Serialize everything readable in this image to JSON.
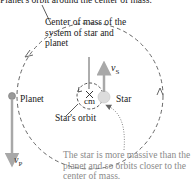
{
  "diagram": {
    "top_caption": "Planet's orbit around the center of mass.",
    "center_of_mass_label": [
      "Center of mass of the",
      "system of star and",
      "planet"
    ],
    "planet_label": "Planet",
    "star_label": "Star",
    "cm_label": "cm",
    "star_orbit_label": "Star's orbit",
    "star_velocity": {
      "symbol": "v",
      "subscript": "S"
    },
    "planet_velocity": {
      "symbol": "v",
      "subscript": "P"
    },
    "note": "The star is more massive than the planet and so orbits closer to the center of mass.",
    "colors": {
      "text": "#1a1a1a",
      "note_text": "#8a8a8a",
      "orbit_dash": "#666666",
      "vector_gray": "#a8a8a8",
      "planet_fill": "#9a9a9a",
      "star_fill": "#dcdcdc"
    }
  }
}
